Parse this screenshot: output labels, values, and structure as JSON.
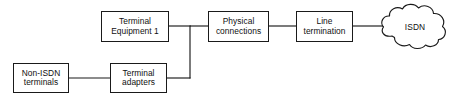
{
  "diagram": {
    "type": "block-diagram",
    "colors": {
      "stroke": "#1a1a1a",
      "fill": "#ffffff",
      "text": "#101010",
      "background": "#ffffff"
    },
    "nodes": [
      {
        "id": "terminal-equipment-1",
        "shape": "rectangle",
        "lines": [
          "Terminal",
          "Equipment 1"
        ],
        "x": 101,
        "y": 11,
        "w": 68,
        "h": 31
      },
      {
        "id": "physical-connections",
        "shape": "rectangle",
        "lines": [
          "Physical",
          "connections"
        ],
        "x": 208,
        "y": 11,
        "w": 61,
        "h": 31
      },
      {
        "id": "line-termination",
        "shape": "rectangle",
        "lines": [
          "Line",
          "termination"
        ],
        "x": 296,
        "y": 11,
        "w": 57,
        "h": 31
      },
      {
        "id": "non-isdn-terminals",
        "shape": "rectangle",
        "lines": [
          "Non-ISDN",
          "terminals"
        ],
        "x": 13,
        "y": 63,
        "w": 56,
        "h": 30
      },
      {
        "id": "terminal-adapters",
        "shape": "rectangle",
        "lines": [
          "Terminal",
          "adapters"
        ],
        "x": 110,
        "y": 63,
        "w": 57,
        "h": 30
      },
      {
        "id": "isdn-cloud",
        "shape": "cloud",
        "lines": [
          "ISDN"
        ],
        "x": 381,
        "y": 6,
        "w": 68,
        "h": 44
      }
    ],
    "connections": [
      {
        "id": "te1-to-junction",
        "from": "terminal-equipment-1",
        "to": "junction",
        "path": "M169,26 L190,26"
      },
      {
        "id": "junction-vertical",
        "from": "junction",
        "to": "junction-bottom",
        "path": "M190,26 L190,78"
      },
      {
        "id": "ta-to-junction",
        "from": "terminal-adapters",
        "to": "junction-bottom",
        "path": "M167,78 L190,78"
      },
      {
        "id": "junction-to-physical",
        "from": "junction",
        "to": "physical-connections",
        "path": "M190,26 L208,26"
      },
      {
        "id": "physical-to-line-termination",
        "from": "physical-connections",
        "to": "line-termination",
        "path": "M269,26 L296,26"
      },
      {
        "id": "line-termination-to-isdn",
        "from": "line-termination",
        "to": "isdn-cloud",
        "path": "M353,26 L383,26"
      },
      {
        "id": "non-isdn-to-terminal-adapters",
        "from": "non-isdn-terminals",
        "to": "terminal-adapters",
        "path": "M69,78 L110,78"
      }
    ]
  }
}
